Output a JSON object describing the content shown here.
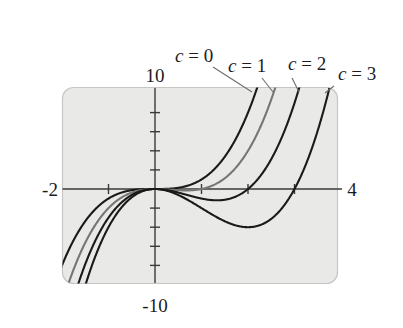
{
  "chart_data": {
    "type": "line",
    "title": "",
    "subtitle": "",
    "xlabel": "",
    "ylabel": "",
    "xlim": [
      -2,
      4
    ],
    "ylim": [
      -10,
      10
    ],
    "grid": false,
    "legend_position": "above-plot-leader-lines",
    "x_tick_labels": [
      "-2",
      "4"
    ],
    "y_tick_labels": [
      "10",
      "-10"
    ],
    "x_ticks": [
      -1,
      1,
      2,
      3
    ],
    "y_ticks": [
      -8,
      -6,
      -4,
      -2,
      2,
      4,
      6,
      8
    ],
    "family_parameter": "c",
    "function_form": "y = x^3 - c x^2",
    "series": [
      {
        "name": "c = 0",
        "c": 0,
        "color": "#1a1a1a",
        "width": 2.1,
        "x_intercepts": [
          0
        ],
        "local_min": null,
        "points_x": [
          -2,
          -1.75,
          -1.5,
          -1.25,
          -1,
          -0.75,
          -0.5,
          -0.25,
          0,
          0.25,
          0.5,
          0.75,
          1,
          1.25,
          1.5,
          1.75,
          2,
          2.154
        ],
        "points_y": [
          -8,
          -5.359,
          -3.375,
          -1.953,
          -1,
          -0.422,
          -0.125,
          -0.016,
          0,
          0.016,
          0.125,
          0.422,
          1,
          1.953,
          3.375,
          5.359,
          8,
          10
        ]
      },
      {
        "name": "c = 1",
        "c": 1,
        "color": "#767676",
        "width": 2.1,
        "x_intercepts": [
          0,
          1
        ],
        "local_min": [
          0.667,
          -0.148
        ],
        "points_x": [
          -2,
          -1.75,
          -1.5,
          -1.25,
          -1,
          -0.75,
          -0.5,
          -0.25,
          0,
          0.25,
          0.5,
          0.75,
          1,
          1.25,
          1.5,
          1.75,
          2,
          2.5,
          2.608
        ],
        "points_y": [
          -12,
          -8.422,
          -5.625,
          -3.516,
          -2,
          -0.984,
          -0.375,
          -0.078,
          0,
          -0.031,
          -0.125,
          -0.141,
          0,
          0.391,
          1.125,
          2.297,
          4,
          9.375,
          10
        ]
      },
      {
        "name": "c = 2",
        "c": 2,
        "color": "#1a1a1a",
        "width": 2.1,
        "x_intercepts": [
          0,
          2
        ],
        "local_min": [
          1.333,
          -1.185
        ],
        "points_x": [
          -2,
          -1.75,
          -1.5,
          -1.25,
          -1,
          -0.75,
          -0.5,
          -0.25,
          0,
          0.25,
          0.5,
          0.75,
          1,
          1.25,
          1.5,
          1.75,
          2,
          2.5,
          3,
          3.1
        ],
        "points_y": [
          -16,
          -11.484,
          -7.875,
          -5.078,
          -3,
          -1.547,
          -0.625,
          -0.141,
          0,
          -0.109,
          -0.375,
          -0.703,
          -1,
          -1.172,
          -1.125,
          -0.766,
          0,
          3.125,
          9,
          10.571
        ]
      },
      {
        "name": "c = 3",
        "c": 3,
        "color": "#1a1a1a",
        "width": 2.1,
        "x_intercepts": [
          0,
          3
        ],
        "local_min": [
          2,
          -4
        ],
        "points_x": [
          -2,
          -1.75,
          -1.5,
          -1.25,
          -1,
          -0.75,
          -0.5,
          -0.25,
          0,
          0.25,
          0.5,
          0.75,
          1,
          1.25,
          1.5,
          1.75,
          2,
          2.25,
          2.5,
          2.75,
          3,
          3.25,
          3.5,
          3.58
        ],
        "points_y": [
          -20,
          -14.547,
          -10.125,
          -6.641,
          -4,
          -2.109,
          -0.875,
          -0.203,
          0,
          -0.172,
          -0.625,
          -1.266,
          -2,
          -2.734,
          -3.375,
          -3.828,
          -4,
          -3.797,
          -3.125,
          -1.891,
          0,
          2.641,
          6.125,
          7.37
        ]
      }
    ]
  },
  "annotations": {
    "labels": [
      {
        "id": "c0",
        "var": "c",
        "rest": " = 0",
        "x": 175,
        "y": 62
      },
      {
        "id": "c1",
        "var": "c",
        "rest": " = 1",
        "x": 228,
        "y": 72
      },
      {
        "id": "c2",
        "var": "c",
        "rest": " = 2",
        "x": 288,
        "y": 70
      },
      {
        "id": "c3",
        "var": "c",
        "rest": " = 3",
        "x": 338,
        "y": 80
      }
    ]
  },
  "axis_labels": {
    "y_max": "10",
    "y_min": "-10",
    "x_min": "-2",
    "x_max": "4"
  },
  "colors": {
    "plot_background": "#e9e9e7",
    "plot_border": "#c6c6c4",
    "axis": "#3a3a3a",
    "curve_dark": "#1a1a1a",
    "curve_gray": "#767676",
    "leader": "#6e6e6e",
    "page_background": "#ffffff"
  }
}
